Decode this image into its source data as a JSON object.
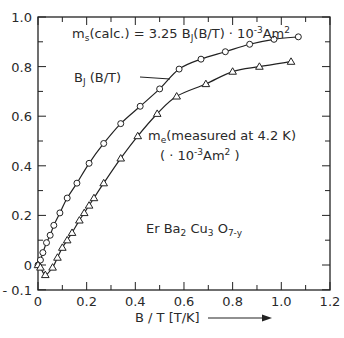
{
  "chart_data": {
    "type": "line",
    "title": "",
    "xlabel": "B / T [T/K]",
    "ylabel": "",
    "xlim": [
      0,
      1.2
    ],
    "ylim": [
      -0.1,
      1.0
    ],
    "x_ticks": [
      "0",
      "0.2",
      "0.4",
      "0.6",
      "0.8",
      "1.0",
      "1.2"
    ],
    "y_ticks": [
      "-0.1",
      "0",
      "0.2",
      "0.4",
      "0.6",
      "0.8",
      "1.0"
    ],
    "grid": false,
    "annotations": {
      "formula": "m_s(calc.) = 3.25 B_J(B/T) · 10^-3 Am^2",
      "brillouin_label": "B_J (B/T)",
      "measured_label_line1": "m_e (measured at 4.2 K)",
      "measured_label_line2": "( · 10^-3 Am^2 )",
      "compound": "Er Ba2 Cu3 O7-y"
    },
    "series": [
      {
        "name": "B_J (B/T) calculated",
        "marker": "circle",
        "points": [
          [
            0.0,
            0.0
          ],
          [
            0.01,
            0.02
          ],
          [
            0.02,
            0.05
          ],
          [
            0.035,
            0.09
          ],
          [
            0.05,
            0.12
          ],
          [
            0.065,
            0.16
          ],
          [
            0.09,
            0.21
          ],
          [
            0.12,
            0.27
          ],
          [
            0.16,
            0.33
          ],
          [
            0.21,
            0.41
          ],
          [
            0.27,
            0.49
          ],
          [
            0.34,
            0.57
          ],
          [
            0.42,
            0.64
          ],
          [
            0.5,
            0.71
          ],
          [
            0.58,
            0.79
          ],
          [
            0.67,
            0.83
          ],
          [
            0.77,
            0.86
          ],
          [
            0.87,
            0.89
          ],
          [
            0.97,
            0.91
          ],
          [
            1.07,
            0.92
          ]
        ]
      },
      {
        "name": "m_e measured at 4.2 K",
        "marker": "triangle",
        "points": [
          [
            0.0,
            0.0
          ],
          [
            0.01,
            -0.01
          ],
          [
            0.03,
            -0.04
          ],
          [
            0.06,
            -0.01
          ],
          [
            0.08,
            0.03
          ],
          [
            0.1,
            0.07
          ],
          [
            0.12,
            0.1
          ],
          [
            0.14,
            0.13
          ],
          [
            0.17,
            0.18
          ],
          [
            0.19,
            0.21
          ],
          [
            0.21,
            0.24
          ],
          [
            0.23,
            0.27
          ],
          [
            0.27,
            0.33
          ],
          [
            0.34,
            0.43
          ],
          [
            0.41,
            0.52
          ],
          [
            0.49,
            0.61
          ],
          [
            0.57,
            0.68
          ],
          [
            0.69,
            0.73
          ],
          [
            0.8,
            0.78
          ],
          [
            0.91,
            0.8
          ],
          [
            1.04,
            0.82
          ]
        ]
      }
    ]
  }
}
